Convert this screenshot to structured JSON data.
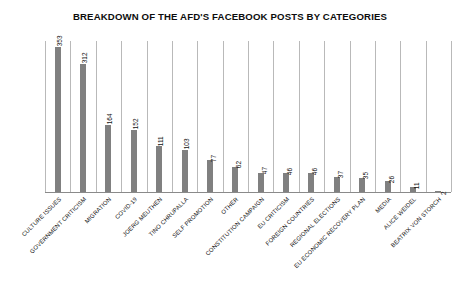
{
  "chart_data": {
    "type": "bar",
    "title": "BREAKDOWN OF THE AFD'S FACEBOOK POSTS BY CATEGORIES",
    "xlabel": "",
    "ylabel": "",
    "grid": "vertical-category-separators",
    "legend": "none",
    "ylim": [
      0,
      370
    ],
    "orientation": "vertical",
    "bar_color": "#808080",
    "categories": [
      "CULTURE ISSUES",
      "GOVERNMENT CRITICISM",
      "MIGRATION",
      "COVID-19",
      "JOERG MEUTHEN",
      "TINO CHRUPALLA",
      "SELF PROMOTION",
      "OTHER",
      "CONSTITUTION CAMPAIGN",
      "EU CRITICISM",
      "FOREIGN COUNTRIES",
      "REGIONAL ELECTIONS",
      "EU ECONOMIC RECOVERY PLAN",
      "MEDIA",
      "ALICE WEIDEL",
      "BEATRIX VON STORCH"
    ],
    "values": [
      353,
      312,
      164,
      152,
      111,
      103,
      77,
      62,
      47,
      46,
      46,
      37,
      35,
      26,
      11,
      2
    ]
  },
  "colors": {
    "bar": "#808080",
    "gridline": "#b9b9b9",
    "axis": "#8a8a8a",
    "text": "#111111",
    "background": "#ffffff"
  }
}
